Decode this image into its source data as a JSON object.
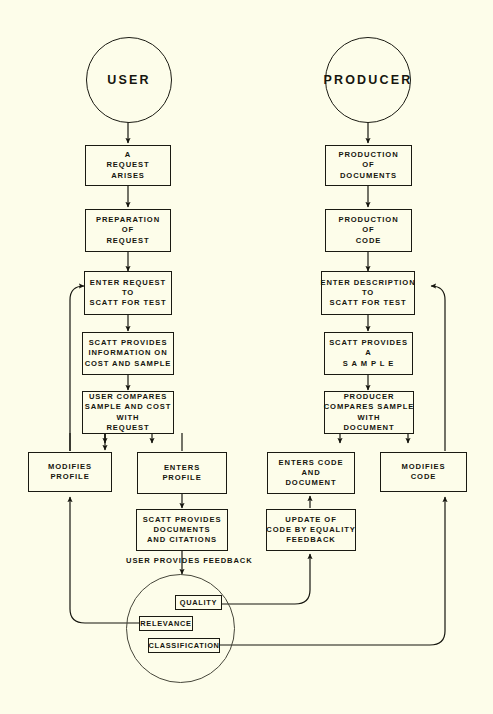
{
  "diagram": {
    "background_color": "#fdfdea",
    "ink_color": "#16160f"
  },
  "actors": {
    "user": "USER",
    "producer": "PRODUCER"
  },
  "user_flow": [
    {
      "id": "request-arises",
      "lines": [
        "A",
        "REQUEST",
        "ARISES"
      ]
    },
    {
      "id": "preparation-of-request",
      "lines": [
        "PREPARATION",
        "OF",
        "REQUEST"
      ]
    },
    {
      "id": "enter-request",
      "lines": [
        "ENTER REQUEST",
        "TO",
        "SCATT  FOR  TEST"
      ]
    },
    {
      "id": "scatt-provides-information",
      "lines": [
        "SCATT PROVIDES",
        "INFORMATION ON",
        "COST AND SAMPLE"
      ]
    },
    {
      "id": "user-compares",
      "lines": [
        "USER  COMPARES",
        "SAMPLE AND COST",
        "WITH",
        "REQUEST"
      ]
    },
    {
      "id": "modifies-profile",
      "lines": [
        "MODIFIES",
        "PROFILE"
      ]
    },
    {
      "id": "enters-profile",
      "lines": [
        "ENTERS",
        "PROFILE"
      ]
    },
    {
      "id": "scatt-provides-documents",
      "lines": [
        "SCATT   PROVIDES",
        "DOCUMENTS",
        "AND CITATIONS"
      ]
    }
  ],
  "producer_flow": [
    {
      "id": "production-of-documents",
      "lines": [
        "PRODUCTION",
        "OF",
        "DOCUMENTS"
      ]
    },
    {
      "id": "production-of-code",
      "lines": [
        "PRODUCTION",
        "OF",
        "CODE"
      ]
    },
    {
      "id": "enter-description",
      "lines": [
        "ENTER DESCRIPTION",
        "TO",
        "SCATT FOR  TEST"
      ]
    },
    {
      "id": "scatt-provides-sample",
      "lines": [
        "SCATT  PROVIDES",
        "A",
        "S A M P L E"
      ]
    },
    {
      "id": "producer-compares",
      "lines": [
        "PRODUCER",
        "COMPARES  SAMPLE",
        "WITH",
        "DOCUMENT"
      ]
    },
    {
      "id": "enters-code-and-document",
      "lines": [
        "ENTERS   CODE",
        "AND",
        "DOCUMENT"
      ]
    },
    {
      "id": "modifies-code",
      "lines": [
        "MODIFIES",
        "CODE"
      ]
    },
    {
      "id": "update-of-code",
      "lines": [
        "UPDATE  OF",
        "CODE BY EQUALITY",
        "FEEDBACK"
      ]
    }
  ],
  "feedback": {
    "caption": "USER  PROVIDES  FEEDBACK",
    "items": [
      {
        "id": "quality",
        "label": "QUALITY"
      },
      {
        "id": "relevance",
        "label": "RELEVANCE"
      },
      {
        "id": "classification",
        "label": "CLASSIFICATION"
      }
    ]
  }
}
